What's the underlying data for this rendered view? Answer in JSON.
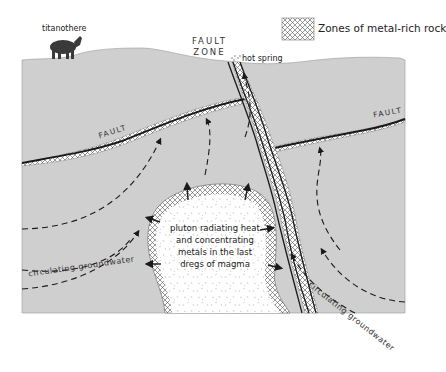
{
  "legend": {
    "swatch_pattern": "crosshatch",
    "label": "Zones of metal-rich rock"
  },
  "labels": {
    "animal": "titanothere",
    "fault_zone_line1": "FAULT",
    "fault_zone_line2": "ZONE",
    "hot_spring": "hot spring",
    "fault_left": "FAULT",
    "fault_right": "FAULT",
    "pluton_line1": "pluton radiating heat",
    "pluton_line2": "and concentrating",
    "pluton_line3": "metals in the last",
    "pluton_line4": "dregs of magma",
    "groundwater_left": "circulating groundwater",
    "groundwater_right": "circulating groundwater"
  },
  "colors": {
    "ground": "#cfcfcf",
    "pluton": "#ffffff",
    "lines": "#1a1a1a",
    "hatch": "#555555"
  }
}
